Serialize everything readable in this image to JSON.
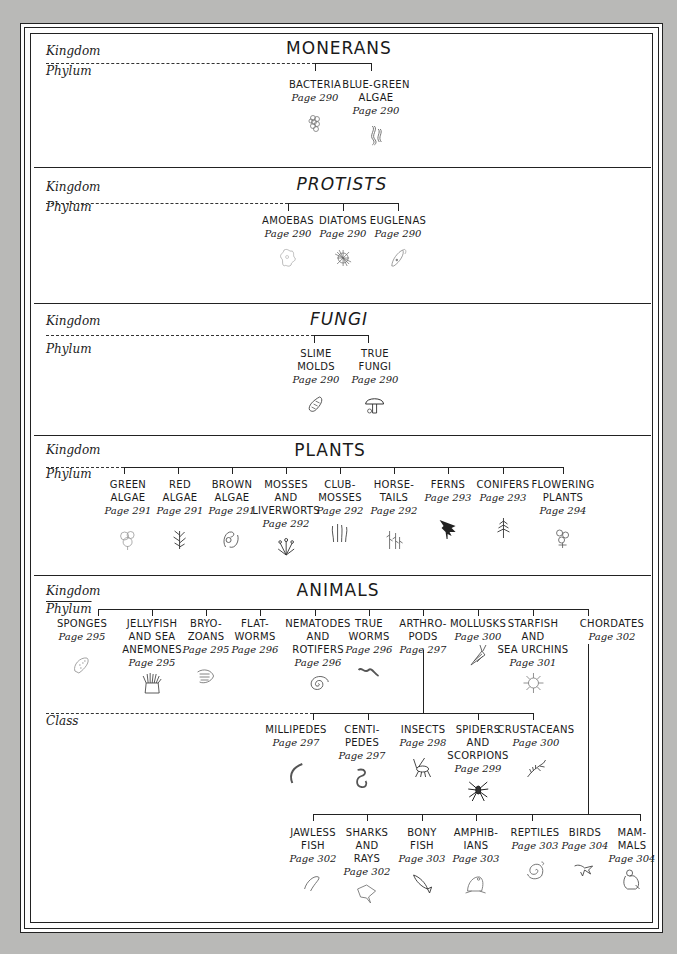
{
  "labels": {
    "kingdom": "Kingdom",
    "phylum": "Phylum",
    "class": "Class"
  },
  "colors": {
    "background": "#b9b9b7",
    "paper": "#ffffff",
    "ink": "#1a1a1a"
  },
  "kingdoms": [
    {
      "name": "MONERANS",
      "phyla": [
        {
          "name": "BACTERIA",
          "page": "Page 290",
          "icon": "bacteria-icon"
        },
        {
          "name": "BLUE-GREEN\nALGAE",
          "page": "Page 290",
          "icon": "blue-green-algae-icon"
        }
      ]
    },
    {
      "name": "PROTISTS",
      "phyla": [
        {
          "name": "AMOEBAS",
          "page": "Page 290",
          "icon": "amoeba-icon"
        },
        {
          "name": "DIATOMS",
          "page": "Page 290",
          "icon": "diatom-icon"
        },
        {
          "name": "EUGLENAS",
          "page": "Page 290",
          "icon": "euglena-icon"
        }
      ]
    },
    {
      "name": "FUNGI",
      "phyla": [
        {
          "name": "SLIME\nMOLDS",
          "page": "Page 290",
          "icon": "slime-mold-icon"
        },
        {
          "name": "TRUE\nFUNGI",
          "page": "Page 290",
          "icon": "mushroom-icon"
        }
      ]
    },
    {
      "name": "PLANTS",
      "phyla": [
        {
          "name": "GREEN\nALGAE",
          "page": "Page 291",
          "icon": "green-algae-icon"
        },
        {
          "name": "RED\nALGAE",
          "page": "Page 291",
          "icon": "red-algae-icon"
        },
        {
          "name": "BROWN\nALGAE",
          "page": "Page 291",
          "icon": "brown-algae-icon"
        },
        {
          "name": "MOSSES\nAND\nLIVERWORTS",
          "page": "Page 292",
          "icon": "moss-icon"
        },
        {
          "name": "CLUB-\nMOSSES",
          "page": "Page\n292",
          "icon": "club-moss-icon"
        },
        {
          "name": "HORSE-\nTAILS",
          "page": "Page 292",
          "icon": "horsetail-icon"
        },
        {
          "name": "FERNS",
          "page": "Page 293",
          "icon": "fern-icon"
        },
        {
          "name": "CONIFERS",
          "page": "Page 293",
          "icon": "conifer-icon"
        },
        {
          "name": "FLOWERING\nPLANTS",
          "page": "Page 294",
          "icon": "flower-icon"
        }
      ]
    },
    {
      "name": "ANIMALS",
      "phyla": [
        {
          "name": "SPONGES",
          "page": "Page 295",
          "icon": "sponge-icon"
        },
        {
          "name": "JELLYFISH\nAND SEA\nANEMONES",
          "page": "Page 295",
          "icon": "anemone-icon"
        },
        {
          "name": "BRYO-\nZOANS",
          "page": "Page 295",
          "icon": "bryozoan-icon"
        },
        {
          "name": "FLAT-\nWORMS",
          "page": "Page 296",
          "icon": "flatworm-icon"
        },
        {
          "name": "NEMATODES\nAND\nROTIFERS",
          "page": "Page 296",
          "icon": "nematode-icon"
        },
        {
          "name": "TRUE\nWORMS",
          "page": "Page 296",
          "icon": "worm-icon"
        },
        {
          "name": "ARTHRO-\nPODS",
          "page": "Page 297",
          "icon": ""
        },
        {
          "name": "MOLLUSKS",
          "page": "Page 300",
          "icon": "snail-icon"
        },
        {
          "name": "STARFISH\nAND\nSEA URCHINS",
          "page": "Page 301",
          "icon": "sea-urchin-icon"
        },
        {
          "name": "CHORDATES",
          "page": "Page 302",
          "icon": ""
        }
      ],
      "arthropod_classes": [
        {
          "name": "MILLIPEDES",
          "page": "Page 297",
          "icon": "millipede-icon"
        },
        {
          "name": "CENTI-\nPEDES",
          "page": "Page 297",
          "icon": "centipede-icon"
        },
        {
          "name": "INSECTS",
          "page": "Page 298",
          "icon": "insect-icon"
        },
        {
          "name": "SPIDERS\nAND\nSCORPIONS",
          "page": "Page 299",
          "icon": "spider-icon"
        },
        {
          "name": "CRUSTACEANS",
          "page": "Page 300",
          "icon": "shrimp-icon"
        }
      ],
      "chordate_classes": [
        {
          "name": "JAWLESS\nFISH",
          "page": "Page 302",
          "icon": "lamprey-icon"
        },
        {
          "name": "SHARKS\nAND\nRAYS",
          "page": "Page 302",
          "icon": "ray-icon"
        },
        {
          "name": "BONY\nFISH",
          "page": "Page 303",
          "icon": "fish-icon"
        },
        {
          "name": "AMPHIB-\nIANS",
          "page": "Page 303",
          "icon": "frog-icon"
        },
        {
          "name": "REPTILES",
          "page": "Page 303",
          "icon": "snake-icon"
        },
        {
          "name": "BIRDS",
          "page": "Page 304",
          "icon": "bird-icon"
        },
        {
          "name": "MAM-\nMALS",
          "page": "Page 304",
          "icon": "gorilla-icon"
        }
      ]
    }
  ]
}
